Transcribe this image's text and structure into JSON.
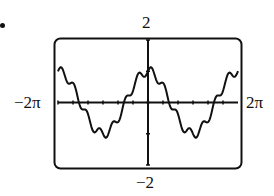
{
  "bullet": "•",
  "window": {
    "xmin_label": "−2π",
    "xmax_label": "2π",
    "ymax_label": "2",
    "ymin_label": "−2"
  },
  "chart_data": {
    "type": "line",
    "title": "",
    "xlabel": "",
    "ylabel": "",
    "xlim": [
      -6.2832,
      6.2832
    ],
    "ylim": [
      -2,
      2
    ],
    "x_tick_labels": [
      "−2π",
      "2π"
    ],
    "y_tick_labels": [
      "2",
      "−2"
    ],
    "x_tick_spacing": 1.0472,
    "y_tick_spacing": 1,
    "grid": false,
    "legend": null,
    "series": [
      {
        "name": "y",
        "approx_formula": "cos(x) + 0.15*sin(7x)",
        "points": [
          [
            -6.2832,
            1.0
          ],
          [
            -5.7596,
            0.95
          ],
          [
            -5.236,
            0.55
          ],
          [
            -4.7124,
            0.05
          ],
          [
            -4.1888,
            -0.55
          ],
          [
            -3.6652,
            -0.9
          ],
          [
            -3.1416,
            -1.1
          ],
          [
            -2.618,
            -0.85
          ],
          [
            -2.0944,
            -0.45
          ],
          [
            -1.5708,
            0.1
          ],
          [
            -1.0472,
            0.55
          ],
          [
            -0.5236,
            0.95
          ],
          [
            0.0,
            1.05
          ],
          [
            0.5236,
            0.8
          ],
          [
            1.0472,
            0.4
          ],
          [
            1.5708,
            -0.15
          ],
          [
            2.0944,
            -0.6
          ],
          [
            2.618,
            -0.95
          ],
          [
            3.1416,
            -1.1
          ],
          [
            3.6652,
            -0.8
          ],
          [
            4.1888,
            -0.35
          ],
          [
            4.7124,
            0.15
          ],
          [
            5.236,
            0.55
          ],
          [
            5.7596,
            0.9
          ],
          [
            6.2832,
            1.0
          ]
        ]
      }
    ]
  },
  "colors": {
    "curve": "#111111",
    "axes": "#111111",
    "frame": "#111111",
    "background": "#ffffff"
  }
}
